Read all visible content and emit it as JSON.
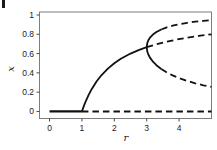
{
  "figure": {
    "background": "#ffffff",
    "frame_color": "#7d7d7d",
    "curve_color": "#121212",
    "tick_color": "#4a4a4a",
    "label_color": "#222222"
  },
  "chart_data": {
    "type": "line",
    "title": "",
    "subtitle": "",
    "xlabel": "r",
    "ylabel": "x",
    "xlim": [
      -0.31,
      5.0
    ],
    "ylim": [
      -0.073,
      1.031
    ],
    "grid": false,
    "legend": false,
    "frame": true,
    "x_ticks": [
      0,
      1,
      2,
      3,
      4
    ],
    "x_tick_labels": [
      "0",
      "1",
      "2",
      "3",
      "4"
    ],
    "y_ticks": [
      0,
      0.2,
      0.4,
      0.6,
      0.8,
      1
    ],
    "y_tick_labels": [
      "0",
      "0.2",
      "0.4",
      "0.6",
      "0.8",
      "1"
    ],
    "series": [
      {
        "name": "zero-branch-stable",
        "style": "solid",
        "width": 2.2,
        "points": [
          [
            0,
            0
          ],
          [
            1,
            0
          ]
        ]
      },
      {
        "name": "zero-branch-unstable",
        "style": "dashed",
        "width": 2.0,
        "points": [
          [
            1,
            0
          ],
          [
            5.0,
            0
          ]
        ]
      },
      {
        "name": "fixed-point-stable",
        "style": "solid",
        "width": 1.8,
        "points": [
          [
            1,
            0
          ],
          [
            1.05,
            0.0476
          ],
          [
            1.1,
            0.0909
          ],
          [
            1.2,
            0.1667
          ],
          [
            1.3,
            0.2308
          ],
          [
            1.45,
            0.3103
          ],
          [
            1.6,
            0.375
          ],
          [
            1.8,
            0.4444
          ],
          [
            2.0,
            0.5
          ],
          [
            2.2,
            0.5455
          ],
          [
            2.5,
            0.6
          ],
          [
            2.75,
            0.6364
          ],
          [
            3.0,
            0.6667
          ]
        ]
      },
      {
        "name": "fixed-point-unstable",
        "style": "dashed",
        "width": 1.8,
        "points": [
          [
            3.0,
            0.6667
          ],
          [
            3.3,
            0.697
          ],
          [
            3.6,
            0.7222
          ],
          [
            3.9,
            0.7436
          ],
          [
            4.2,
            0.7619
          ],
          [
            4.6,
            0.7826
          ],
          [
            5.0,
            0.8
          ]
        ]
      },
      {
        "name": "period2-upper-stable",
        "style": "solid",
        "width": 1.8,
        "points": [
          [
            3.0,
            0.6667
          ],
          [
            3.02,
            0.7125
          ],
          [
            3.05,
            0.7377
          ],
          [
            3.1,
            0.7646
          ],
          [
            3.2,
            0.7995
          ],
          [
            3.3,
            0.8236
          ],
          [
            3.449,
            0.8499
          ]
        ]
      },
      {
        "name": "period2-upper-unstable",
        "style": "dashed",
        "width": 1.8,
        "points": [
          [
            3.449,
            0.8499
          ],
          [
            3.6,
            0.8696
          ],
          [
            3.8,
            0.8894
          ],
          [
            4.0,
            0.9045
          ],
          [
            4.25,
            0.919
          ],
          [
            4.5,
            0.9303
          ],
          [
            4.75,
            0.9392
          ],
          [
            5.0,
            0.9464
          ]
        ]
      },
      {
        "name": "period2-lower-stable",
        "style": "solid",
        "width": 1.8,
        "points": [
          [
            3.0,
            0.6667
          ],
          [
            3.02,
            0.6186
          ],
          [
            3.05,
            0.5902
          ],
          [
            3.1,
            0.558
          ],
          [
            3.2,
            0.513
          ],
          [
            3.3,
            0.4794
          ],
          [
            3.449,
            0.4401
          ]
        ]
      },
      {
        "name": "period2-lower-unstable",
        "style": "dashed",
        "width": 1.8,
        "points": [
          [
            3.449,
            0.4401
          ],
          [
            3.6,
            0.4082
          ],
          [
            3.8,
            0.3737
          ],
          [
            4.0,
            0.3455
          ],
          [
            4.25,
            0.3163
          ],
          [
            4.5,
            0.292
          ],
          [
            4.75,
            0.2714
          ],
          [
            5.0,
            0.2536
          ]
        ]
      }
    ]
  }
}
